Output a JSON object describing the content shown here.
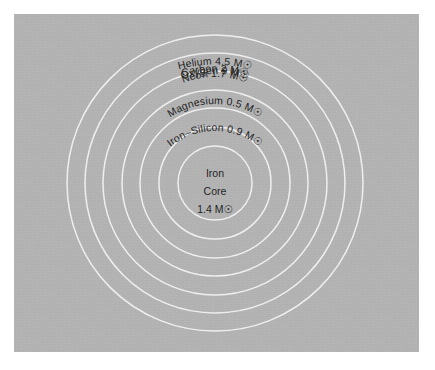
{
  "figure": {
    "kind": "concentric-shell-diagram",
    "panel": {
      "background_color": "#b4b4b4",
      "ring_color": "#f2f2f2",
      "text_color": "#1c1c1c",
      "page_background_color": "#ffffff"
    },
    "geometry": {
      "center_x": 201,
      "center_y": 169,
      "radii": [
        148,
        130,
        112,
        93,
        75,
        56,
        37
      ]
    },
    "solar_mass_symbol": "☉",
    "mass_unit_letter": "M"
  },
  "shells": [
    {
      "id": "helium",
      "element": "Helium",
      "mass_value": "4.5",
      "label": "Helium 4.5 M☉",
      "radius": 148,
      "label_radius": 141,
      "rotation_deg": 0,
      "label_y": 42
    },
    {
      "id": "carbon",
      "element": "Carbon",
      "mass_value": "2",
      "label": "Carbon 2 M☉",
      "radius": 130,
      "label_radius": 123,
      "rotation_deg": 0,
      "label_y": 64
    },
    {
      "id": "oxygen",
      "element": "Oxygen",
      "mass_value": "9",
      "label": "Oxygen 9 M☉",
      "radius": 112,
      "label_radius": 105,
      "rotation_deg": 0,
      "label_y": 86
    },
    {
      "id": "neon",
      "element": "Neon",
      "mass_value": "1.7",
      "label": "Neon 1.7 M☉",
      "radius": 93,
      "label_radius": 86,
      "rotation_deg": 0,
      "label_y": 108
    },
    {
      "id": "magnesium",
      "element": "Magnesium",
      "mass_value": "0.5",
      "label": "Magnesium 0.5 M☉",
      "radius": 75,
      "label_radius": 68,
      "rotation_deg": 0,
      "label_y": 130
    },
    {
      "id": "iron-silicon",
      "element": "Iron–Silicon",
      "mass_value": "0.9",
      "label": "Iron–Silicon 0.9 M☉",
      "radius": 56,
      "label_radius": 49,
      "rotation_deg": 0,
      "label_y": 151
    }
  ],
  "core": {
    "id": "iron-core",
    "radius": 37,
    "line1": "Iron",
    "line2": "Core",
    "line3": "1.4 M☉",
    "element": "Iron",
    "mass_value": "1.4"
  }
}
